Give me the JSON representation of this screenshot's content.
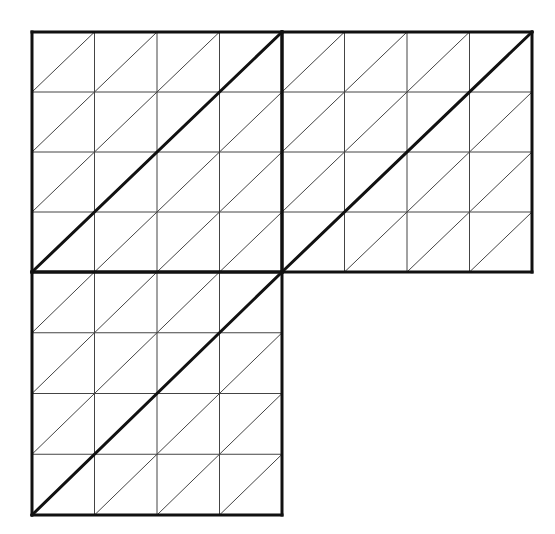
{
  "figure": {
    "colors": {
      "background": "#ffffff",
      "thin_line": "#444444",
      "thick_line": "#111111"
    },
    "grid_divisions": 4,
    "squares": [
      {
        "name": "top-left",
        "x": 32,
        "y": 32,
        "w": 250,
        "h": 240
      },
      {
        "name": "top-right",
        "x": 282,
        "y": 32,
        "w": 250,
        "h": 240
      },
      {
        "name": "bottom-left",
        "x": 32,
        "y": 272,
        "w": 250,
        "h": 243
      }
    ]
  }
}
